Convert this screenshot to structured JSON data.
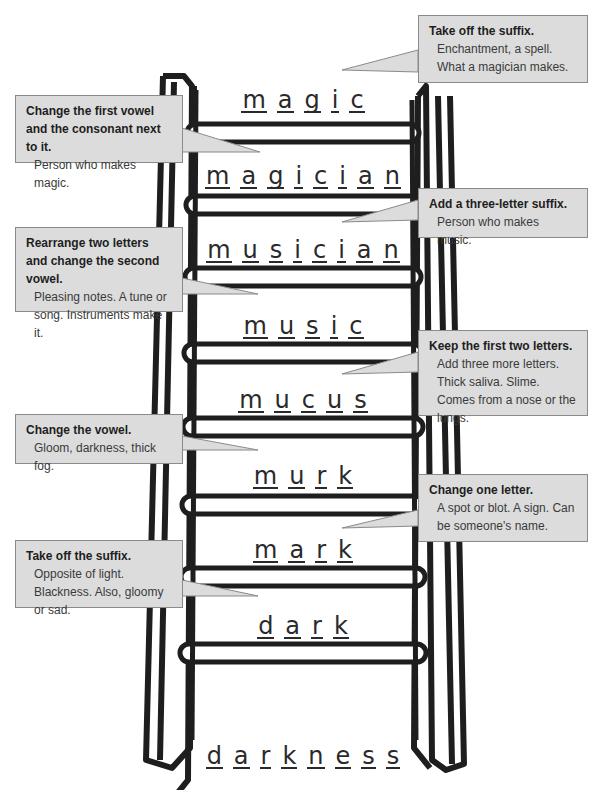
{
  "ladder_words": [
    {
      "word": "magic",
      "letters": [
        "m",
        "a",
        "g",
        "i",
        "c"
      ]
    },
    {
      "word": "magician",
      "letters": [
        "m",
        "a",
        "g",
        "i",
        "c",
        "i",
        "a",
        "n"
      ]
    },
    {
      "word": "musician",
      "letters": [
        "m",
        "u",
        "s",
        "i",
        "c",
        "i",
        "a",
        "n"
      ]
    },
    {
      "word": "music",
      "letters": [
        "m",
        "u",
        "s",
        "i",
        "c"
      ]
    },
    {
      "word": "mucus",
      "letters": [
        "m",
        "u",
        "c",
        "u",
        "s"
      ]
    },
    {
      "word": "murk",
      "letters": [
        "m",
        "u",
        "r",
        "k"
      ]
    },
    {
      "word": "mark",
      "letters": [
        "m",
        "a",
        "r",
        "k"
      ]
    },
    {
      "word": "dark",
      "letters": [
        "d",
        "a",
        "r",
        "k"
      ]
    },
    {
      "word": "darkness",
      "letters": [
        "d",
        "a",
        "r",
        "k",
        "n",
        "e",
        "s",
        "s"
      ]
    }
  ],
  "clues": [
    {
      "side": "right",
      "bold": "Take off the suffix.",
      "text": "Enchantment, a spell. What a magician makes."
    },
    {
      "side": "left",
      "bold": "Change the first vowel and the consonant next to it.",
      "text": "Person who makes magic."
    },
    {
      "side": "right",
      "bold": "Add a three-letter suffix.",
      "text": "Person who makes music."
    },
    {
      "side": "left",
      "bold": "Rearrange two letters and change the second vowel.",
      "text": "Pleasing notes. A tune or song. Instruments make it."
    },
    {
      "side": "right",
      "bold": "Keep the first two letters.",
      "text": "Add three more letters. Thick saliva. Slime. Comes from a nose or the lungs."
    },
    {
      "side": "left",
      "bold": "Change the vowel.",
      "text": "Gloom, darkness, thick fog."
    },
    {
      "side": "right",
      "bold": "Change one letter.",
      "text": "A spot or blot. A sign. Can be someone's name."
    },
    {
      "side": "left",
      "bold": "Take off the suffix.",
      "text": "Opposite of light. Blackness. Also, gloomy or sad."
    }
  ],
  "colors": {
    "callout_bg": "#dcdcdc",
    "ink": "#1e1e1e"
  }
}
